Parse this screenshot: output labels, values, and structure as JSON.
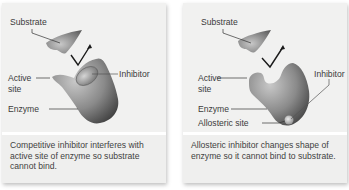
{
  "panels": [
    {
      "id": "competitive",
      "labels": {
        "substrate": "Substrate",
        "active_site_1": "Active",
        "active_site_2": "site",
        "inhibitor": "Inhibitor",
        "enzyme": "Enzyme"
      },
      "caption": "Competitive inhibitor interferes with active site of enzyme so substrate cannot bind."
    },
    {
      "id": "allosteric",
      "labels": {
        "substrate": "Substrate",
        "active_site_1": "Active",
        "active_site_2": "site",
        "inhibitor": "Inhibitor",
        "enzyme": "Enzyme",
        "allosteric_site": "Allosteric site"
      },
      "caption": "Allosteric inhibitor changes shape of enzyme so it cannot bind to substrate."
    }
  ],
  "colors": {
    "panel_bg": "#f1f1f0",
    "shape_dark": "#4a4a4a",
    "shape_light": "#b5b5b5",
    "text": "#3b3b3b"
  }
}
